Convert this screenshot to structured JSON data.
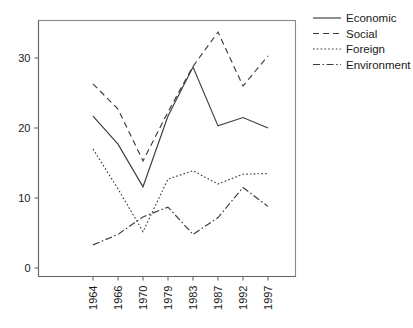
{
  "chart_data": {
    "type": "line",
    "title": "",
    "subtitle": "",
    "xlabel": "",
    "ylabel": "",
    "categories": [
      "1964",
      "1966",
      "1970",
      "1979",
      "1983",
      "1987",
      "1992",
      "1997"
    ],
    "x_tick_labels": [
      "1964",
      "1966",
      "1970",
      "1979",
      "1983",
      "1987",
      "1992",
      "1997"
    ],
    "x_tick_rotation": 90,
    "y_tick_labels": [
      "0",
      "10",
      "20",
      "30"
    ],
    "y_ticks": [
      0,
      10,
      20,
      30
    ],
    "ylim": [
      -2,
      36
    ],
    "xlim": [
      -1.2,
      7.9
    ],
    "grid": false,
    "legend_position": "right-top",
    "series": [
      {
        "name": "Economic",
        "style": "solid",
        "color": "#3b3b45",
        "values": [
          21.7,
          17.7,
          11.6,
          21.7,
          28.7,
          20.3,
          21.5,
          20.0
        ]
      },
      {
        "name": "Social",
        "style": "dashed",
        "color": "#3b3b45",
        "values": [
          26.3,
          22.7,
          15.3,
          22.3,
          28.8,
          33.7,
          26.0,
          30.3
        ]
      },
      {
        "name": "Foreign",
        "style": "dotted",
        "color": "#3b3b45",
        "values": [
          17.0,
          11.3,
          5.2,
          12.7,
          13.9,
          12.0,
          13.4,
          13.5
        ]
      },
      {
        "name": "Environment",
        "style": "dash-dot",
        "color": "#3b3b45",
        "values": [
          3.3,
          4.8,
          7.3,
          8.7,
          4.8,
          7.2,
          11.5,
          8.8
        ]
      }
    ]
  },
  "legend": {
    "items": [
      {
        "label": "Economic"
      },
      {
        "label": "Social"
      },
      {
        "label": "Foreign"
      },
      {
        "label": "Environment"
      }
    ]
  },
  "axes": {
    "y_labels": [
      "30",
      "20",
      "10",
      "0"
    ],
    "x_labels": [
      "1964",
      "1966",
      "1970",
      "1979",
      "1983",
      "1987",
      "1992",
      "1997"
    ]
  }
}
